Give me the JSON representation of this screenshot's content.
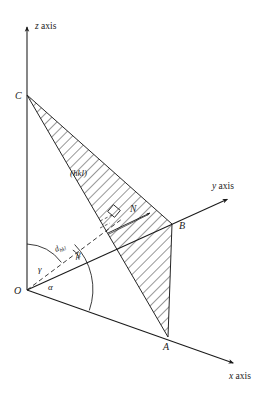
{
  "figure": {
    "type": "crystallographic-plane-diagram",
    "background_color": "#ffffff",
    "line_color": "#1a1a1a",
    "hatch_color": "#1a1a1a"
  },
  "axes": [
    {
      "name": "z-axis",
      "label": "z axis",
      "label_italic_part": "z",
      "label_roman_part": " axis",
      "origin": [
        27,
        290
      ],
      "tip": [
        27,
        24
      ],
      "label_position": [
        35,
        29
      ],
      "arrow": true,
      "style": "solid"
    },
    {
      "name": "y-axis",
      "label": "y axis",
      "label_italic_part": "y",
      "label_roman_part": " axis",
      "origin": [
        27,
        290
      ],
      "tip": [
        230,
        198
      ],
      "label_position": [
        212,
        189
      ],
      "arrow": true,
      "style": "solid"
    },
    {
      "name": "x-axis",
      "label": "x axis",
      "label_italic_part": "x",
      "label_roman_part": " axis",
      "origin": [
        27,
        290
      ],
      "tip": [
        236,
        364
      ],
      "label_position": [
        229,
        379
      ],
      "arrow": true,
      "style": "solid"
    }
  ],
  "vertices": [
    {
      "name": "O",
      "label": "O",
      "point": [
        27,
        290
      ],
      "label_position": [
        14,
        294
      ]
    },
    {
      "name": "C",
      "label": "C",
      "point": [
        27,
        95
      ],
      "label_position": [
        15,
        99
      ]
    },
    {
      "name": "B",
      "label": "B",
      "point": [
        172,
        224
      ],
      "label_position": [
        179,
        229
      ]
    },
    {
      "name": "A",
      "label": "A",
      "point": [
        168,
        337
      ],
      "label_position": [
        163,
        350
      ]
    }
  ],
  "plane": {
    "name": "hkl-plane",
    "label": "(hkl)",
    "label_position": [
      70,
      176
    ],
    "vertices": [
      [
        27,
        95
      ],
      [
        172,
        224
      ],
      [
        168,
        337
      ]
    ],
    "hatched": true,
    "hatch_angle_deg": 45,
    "hatch_spacing_px": 7
  },
  "normal": {
    "name": "plane-normal",
    "label": "N",
    "label_position": [
      130,
      212
    ],
    "from": [
      108,
      233
    ],
    "to": [
      150,
      213
    ],
    "right_angle_marker": {
      "center": [
        114,
        211
      ],
      "size": 9,
      "rotation_deg": 40
    }
  },
  "dspacing": {
    "name": "d-hkl",
    "label": "d",
    "subscript": "hkl",
    "label_position": [
      56,
      252
    ],
    "label_rotation_deg": -25,
    "from": [
      27,
      290
    ],
    "to": [
      122,
      219
    ],
    "style": "dashed"
  },
  "angles": [
    {
      "name": "gamma",
      "label": "γ",
      "label_position": [
        38,
        272
      ],
      "between": [
        "z-axis",
        "d-hkl"
      ],
      "arc_radius": 46
    },
    {
      "name": "alpha",
      "label": "α",
      "label_position": [
        48,
        290
      ],
      "between": [
        "d-hkl",
        "x-axis"
      ],
      "arc_radius": 64
    },
    {
      "name": "beta",
      "label": "β",
      "label_position": [
        76,
        258
      ],
      "between": [
        "d-hkl",
        "y-axis"
      ],
      "arc_radius": 12
    }
  ],
  "edges": [
    {
      "name": "edge-O-C",
      "from": [
        27,
        290
      ],
      "to": [
        27,
        95
      ],
      "style": "solid"
    },
    {
      "name": "edge-O-B",
      "from": [
        27,
        290
      ],
      "to": [
        172,
        224
      ],
      "style": "solid"
    },
    {
      "name": "edge-O-A",
      "from": [
        27,
        290
      ],
      "to": [
        168,
        337
      ],
      "style": "solid"
    },
    {
      "name": "edge-C-B",
      "from": [
        27,
        95
      ],
      "to": [
        172,
        224
      ],
      "style": "solid"
    },
    {
      "name": "edge-C-A",
      "from": [
        27,
        95
      ],
      "to": [
        168,
        337
      ],
      "style": "solid"
    },
    {
      "name": "edge-B-A",
      "from": [
        172,
        224
      ],
      "to": [
        168,
        337
      ],
      "style": "solid"
    }
  ]
}
